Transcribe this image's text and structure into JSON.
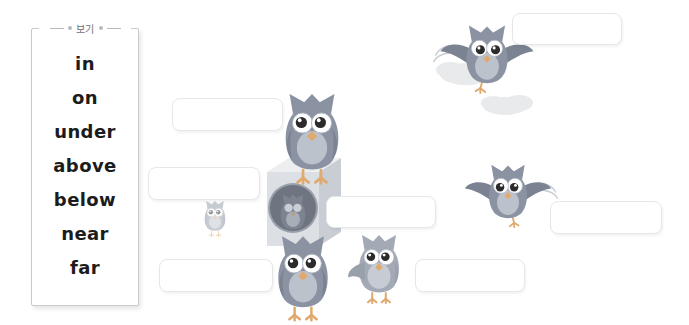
{
  "worksheet": {
    "title": "Prepositions of place picture worksheet",
    "wordbank": {
      "label": "보기",
      "words": [
        "in",
        "on",
        "under",
        "above",
        "below",
        "near",
        "far"
      ]
    },
    "blanks": [
      {
        "name": "blank-above",
        "value": "",
        "placeholder": ""
      },
      {
        "name": "blank-on",
        "value": "",
        "placeholder": ""
      },
      {
        "name": "blank-far",
        "value": "",
        "placeholder": ""
      },
      {
        "name": "blank-in",
        "value": "",
        "placeholder": ""
      },
      {
        "name": "blank-near",
        "value": "",
        "placeholder": ""
      },
      {
        "name": "blank-under",
        "value": "",
        "placeholder": ""
      },
      {
        "name": "blank-below",
        "value": "",
        "placeholder": ""
      }
    ],
    "colors": {
      "owl_body": "#8b93a3",
      "owl_body_light": "#a9afbb",
      "owl_belly": "#b9bfc9",
      "owl_beak": "#e0a96d",
      "owl_foot": "#e0a96d",
      "owl_eye_white": "#ffffff",
      "owl_pupil": "#2b2b2b",
      "box_front": "#dcdfe3",
      "box_top": "#eceef0",
      "box_side": "#c9ced4",
      "window": "#6e7480",
      "cloud": "#e9eaec",
      "blank_border": "#e6e7e9",
      "panel_border": "#c9cacc",
      "text": "#1c1c1c",
      "label_text": "#6e7073",
      "background": "#ffffff"
    },
    "scene": {
      "owls": [
        {
          "name": "owl-flying-above",
          "pose": "flying",
          "size": "medium"
        },
        {
          "name": "owl-on-box",
          "pose": "perched",
          "size": "large"
        },
        {
          "name": "owl-in-window",
          "pose": "inside",
          "size": "small"
        },
        {
          "name": "owl-far-left",
          "pose": "standing",
          "size": "tiny"
        },
        {
          "name": "owl-flying-right",
          "pose": "flying",
          "size": "medium"
        },
        {
          "name": "owl-under-box",
          "pose": "standing",
          "size": "large"
        },
        {
          "name": "owl-beside-box",
          "pose": "standing",
          "size": "medium"
        }
      ],
      "clouds": [
        {
          "name": "cloud-upper"
        },
        {
          "name": "cloud-lower"
        }
      ],
      "box": {
        "name": "washing-machine-box"
      }
    }
  }
}
